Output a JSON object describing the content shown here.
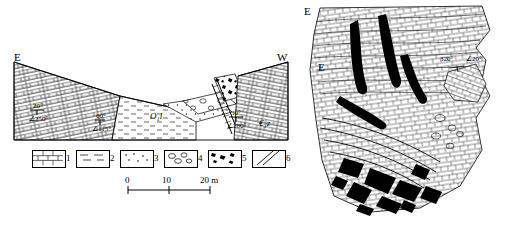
{
  "figure": {
    "left_panel": {
      "name": "geological-cross-section",
      "direction_left": "E",
      "direction_right": "W",
      "unit_labels": [
        {
          "text": "O₁l",
          "x": 150,
          "y": 117
        },
        {
          "text": "€₃z",
          "x": 262,
          "y": 124
        }
      ],
      "bedding_measurements": [
        {
          "dip_dir": "20°",
          "strike": "∠250°",
          "x": 33,
          "y": 116
        },
        {
          "dip_dir": "60°",
          "strike": "∠115°",
          "x": 98,
          "y": 127
        },
        {
          "dip_dir": "30°",
          "strike": "∠280°",
          "x": 232,
          "y": 123
        }
      ],
      "legend": {
        "items": [
          {
            "num": "1",
            "pattern": "brick-limestone"
          },
          {
            "num": "2",
            "pattern": "dashed-shale"
          },
          {
            "num": "3",
            "pattern": "dotted-sandstone"
          },
          {
            "num": "4",
            "pattern": "pebble-conglomerate"
          },
          {
            "num": "5",
            "pattern": "breccia-blocks"
          },
          {
            "num": "6",
            "pattern": "fault-line"
          }
        ]
      },
      "scale_bar": {
        "ticks": [
          "0",
          "10",
          "20 m"
        ],
        "unit": "m"
      }
    },
    "right_panel": {
      "name": "outcrop-sketch",
      "direction_top_left": "E",
      "direction_left": "E",
      "measurement": {
        "dip_dir": "320°",
        "strike": "∠20°",
        "x": 147,
        "y": 65
      }
    }
  }
}
